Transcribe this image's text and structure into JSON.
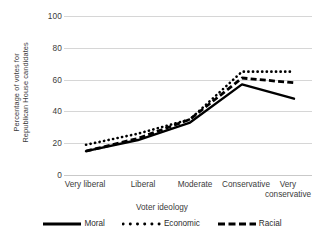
{
  "chart_data": {
    "type": "line",
    "title": "",
    "xlabel": "Voter ideology",
    "ylabel": "Percentage of votes for Republican House candidates",
    "ylabel_line1": "Percentage of votes for",
    "ylabel_line2": "Republican House candidates",
    "categories": [
      "Very liberal",
      "Liberal",
      "Moderate",
      "Conservative",
      "Very conservative"
    ],
    "category_labels_wrapped": [
      [
        "Very liberal"
      ],
      [
        "Liberal"
      ],
      [
        "Moderate"
      ],
      [
        "Conservative"
      ],
      [
        "Very",
        "conservative"
      ]
    ],
    "yticks": [
      100,
      80,
      60,
      40,
      20,
      0
    ],
    "ylim": [
      0,
      100
    ],
    "grid": true,
    "legend_position": "bottom",
    "series": [
      {
        "name": "Moral",
        "style": "solid",
        "color": "#000000",
        "values": [
          15,
          22,
          33,
          57,
          48
        ]
      },
      {
        "name": "Economic",
        "style": "dotted",
        "color": "#000000",
        "values": [
          19,
          26,
          35,
          65,
          65
        ]
      },
      {
        "name": "Racial",
        "style": "dashed",
        "color": "#000000",
        "values": [
          15,
          23,
          35,
          61,
          58
        ]
      }
    ]
  },
  "axis": {
    "y_tick_labels": [
      "100",
      "80",
      "60",
      "40",
      "20",
      "0"
    ],
    "y_title_line1": "Percentage of votes for",
    "y_title_line2": "Republican House candidates",
    "x_title": "Voter ideology",
    "x_tick_1": "Very liberal",
    "x_tick_2": "Liberal",
    "x_tick_3": "Moderate",
    "x_tick_4": "Conservative",
    "x_tick_5_line1": "Very",
    "x_tick_5_line2": "conservative"
  },
  "legend": {
    "items": [
      {
        "label": "Moral",
        "style": "solid"
      },
      {
        "label": "Economic",
        "style": "dotted"
      },
      {
        "label": "Racial",
        "style": "dashed"
      }
    ]
  }
}
